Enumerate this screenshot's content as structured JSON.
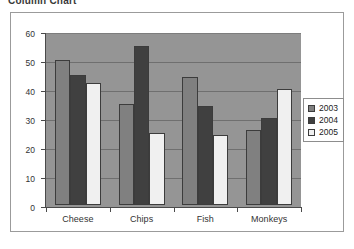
{
  "page": {
    "title": "Column Chart"
  },
  "chart_data": {
    "type": "bar",
    "title": "Column Chart",
    "xlabel": "",
    "ylabel": "",
    "ylim": [
      0,
      60
    ],
    "ytick_step": 10,
    "yticks": [
      0,
      10,
      20,
      30,
      40,
      50,
      60
    ],
    "ytick_labels": [
      "0",
      "10",
      "20",
      "30",
      "40",
      "50",
      "60"
    ],
    "grid": true,
    "legend_position": "right",
    "plot_background": "#959595",
    "chart_background": "#ffffff",
    "categories": [
      "Cheese",
      "Chips",
      "Fish",
      "Monkeys"
    ],
    "series": [
      {
        "name": "2003",
        "color": "#808080",
        "values": [
          50,
          35,
          44,
          26
        ]
      },
      {
        "name": "2004",
        "color": "#404040",
        "values": [
          45,
          55,
          34,
          30
        ]
      },
      {
        "name": "2005",
        "color": "#f0f0f0",
        "values": [
          42,
          25,
          24,
          40
        ]
      }
    ]
  }
}
